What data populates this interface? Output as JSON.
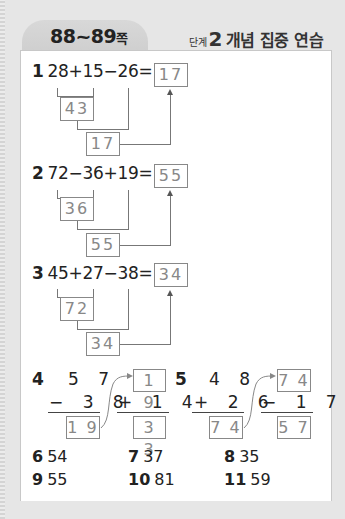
{
  "header": {
    "page_range": "88~89",
    "page_suffix": "쪽",
    "step_label": "단계",
    "step_number": "2",
    "title": "개념 집중 연습"
  },
  "problems": [
    {
      "num": "1",
      "expression": "28+15−26=",
      "first_result": "43",
      "second_result": "17",
      "answer": "17"
    },
    {
      "num": "2",
      "expression": "72−36+19=",
      "first_result": "36",
      "second_result": "55",
      "answer": "55"
    },
    {
      "num": "3",
      "expression": "45+27−38=",
      "first_result": "72",
      "second_result": "34",
      "answer": "34"
    }
  ],
  "vertical": [
    {
      "num": "4",
      "top": "5 7",
      "op_line": "− 3 8",
      "result": "1 9",
      "carry_top": "1 9",
      "op_line2": "+ 1 4",
      "final": "3 3"
    },
    {
      "num": "5",
      "top": "4 8",
      "op_line": "+ 2 6",
      "result": "7 4",
      "carry_top": "7 4",
      "op_line2": "− 1 7",
      "final": "5 7"
    }
  ],
  "answers": [
    {
      "num": "6",
      "value": "54"
    },
    {
      "num": "7",
      "value": "37"
    },
    {
      "num": "8",
      "value": "35"
    },
    {
      "num": "9",
      "value": "55"
    },
    {
      "num": "10",
      "value": "81"
    },
    {
      "num": "11",
      "value": "59"
    }
  ]
}
